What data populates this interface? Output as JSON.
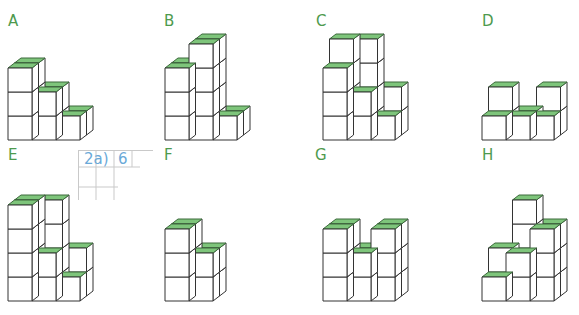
{
  "colors": {
    "top_face": "#7ec57b",
    "top_face_stroke": "#3d6b3d",
    "edge": "#333333",
    "face": "#ffffff",
    "label": "#4e9a4e",
    "handwriting": "#6aa9d8",
    "grid_line": "#c9c9c9"
  },
  "cube": {
    "size": 24,
    "depth_dx": 6.5,
    "depth_dy": -5
  },
  "figures": [
    {
      "id": "A",
      "label": "A",
      "label_pos": [
        8,
        28
      ],
      "origin": [
        8,
        140
      ],
      "columns": [
        [
          3,
          3
        ],
        [
          2,
          2
        ],
        [
          1,
          1
        ]
      ]
    },
    {
      "id": "B",
      "label": "B",
      "label_pos": [
        164,
        28
      ],
      "origin": [
        165,
        140
      ],
      "columns": [
        [
          3,
          3
        ],
        [
          4,
          4
        ],
        [
          1,
          1
        ]
      ]
    },
    {
      "id": "C",
      "label": "C",
      "label_pos": [
        316,
        28
      ],
      "origin": [
        323,
        140
      ],
      "columns": [
        [
          3,
          4
        ],
        [
          2,
          4
        ],
        [
          1,
          2
        ]
      ]
    },
    {
      "id": "D",
      "label": "D",
      "label_pos": [
        482,
        28
      ],
      "origin": [
        482,
        140
      ],
      "columns": [
        [
          1,
          2
        ],
        [
          1,
          1
        ],
        [
          1,
          2
        ]
      ]
    },
    {
      "id": "E",
      "label": "E",
      "label_pos": [
        8,
        162
      ],
      "origin": [
        8,
        301
      ],
      "columns": [
        [
          4,
          4
        ],
        [
          2,
          4
        ],
        [
          1,
          2
        ]
      ]
    },
    {
      "id": "F",
      "label": "F",
      "label_pos": [
        164,
        162
      ],
      "origin": [
        165,
        301
      ],
      "columns": [
        [
          3,
          3
        ],
        [
          2,
          2
        ]
      ]
    },
    {
      "id": "G",
      "label": "G",
      "label_pos": [
        315,
        162
      ],
      "origin": [
        323,
        301
      ],
      "columns": [
        [
          3,
          3
        ],
        [
          2,
          2
        ],
        [
          3,
          3
        ]
      ]
    },
    {
      "id": "H",
      "label": "H",
      "label_pos": [
        482,
        162
      ],
      "origin": [
        482,
        301
      ],
      "columns": [
        [
          1,
          2
        ],
        [
          2,
          4
        ],
        [
          3,
          3
        ]
      ]
    }
  ],
  "handwritten_note": {
    "cells": [
      "2a)",
      "6"
    ]
  }
}
